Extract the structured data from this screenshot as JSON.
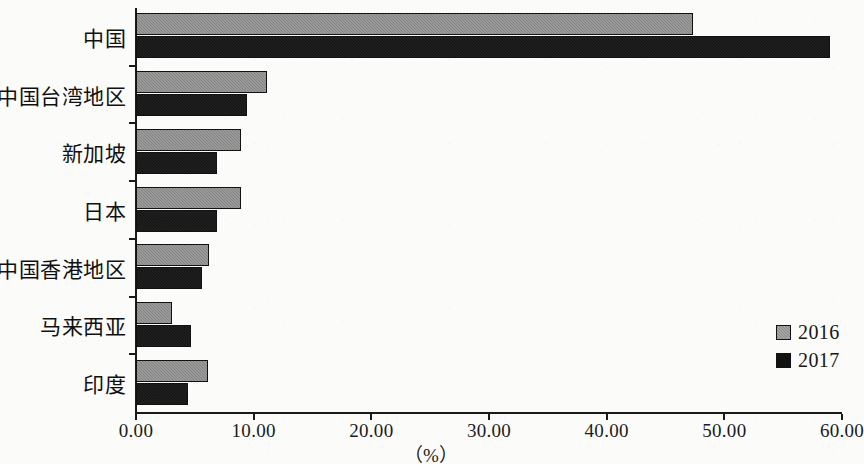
{
  "chart_data": {
    "type": "bar",
    "orientation": "horizontal",
    "title": "",
    "subtitle": "",
    "xlabel": "（%）",
    "ylabel": "",
    "xlim": [
      0,
      60
    ],
    "xticks": [
      0,
      10,
      20,
      30,
      40,
      50,
      60
    ],
    "xtick_labels": [
      "0.00",
      "10.00",
      "20.00",
      "30.00",
      "40.00",
      "50.00",
      "60.00"
    ],
    "grid": false,
    "legend_position": "right-bottom",
    "categories": [
      "中国",
      "中国台湾地区",
      "新加坡",
      "日本",
      "中国香港地区",
      "马来西亚",
      "印度"
    ],
    "series": [
      {
        "name": "2016",
        "color": "#8b8b8b",
        "values": [
          47.3,
          11.1,
          8.9,
          8.9,
          6.2,
          3.1,
          6.1
        ]
      },
      {
        "name": "2017",
        "color": "#121212",
        "values": [
          59.0,
          9.4,
          6.9,
          6.9,
          5.6,
          4.7,
          4.4
        ]
      }
    ]
  },
  "legend": {
    "items": [
      {
        "label": "2016",
        "color": "#8b8b8b"
      },
      {
        "label": "2017",
        "color": "#121212"
      }
    ]
  },
  "axis": {
    "unit_label": "（%）"
  }
}
